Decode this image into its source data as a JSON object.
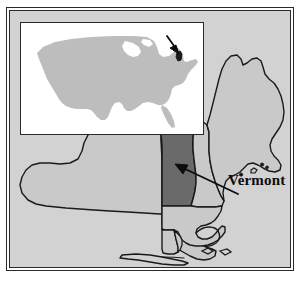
{
  "figure": {
    "kind": "locator-map",
    "subject": "Vermont",
    "region_title": "Northeastern United States",
    "label": "Vermont",
    "colors": {
      "highlight": "#6a6a6a",
      "state_fill": "#c9c9c9",
      "map_background": "#d2d2d2",
      "inset_background": "#ffffff",
      "inset_landmass": "#bdbdbd",
      "outline": "#1a1a1a",
      "frame": "#2b2b2b",
      "text": "#0d0d0d",
      "page_background": "#ffffff"
    },
    "frame": {
      "outer_border_width_px": 1,
      "inner_border_width_px": 1
    },
    "inset": {
      "name": "united-states-locator-inset",
      "landmass": "Contiguous United States",
      "marker": "Vermont",
      "pointer": "arrow",
      "pointer_direction": "down-right"
    },
    "main_map": {
      "name": "northeast-states-map",
      "highlighted_state": "Vermont",
      "pointer": "arrow",
      "pointer_direction": "up-left",
      "states_shown": [
        "New York",
        "Vermont",
        "New Hampshire",
        "Maine",
        "Massachusetts",
        "Connecticut",
        "Rhode Island"
      ]
    }
  }
}
